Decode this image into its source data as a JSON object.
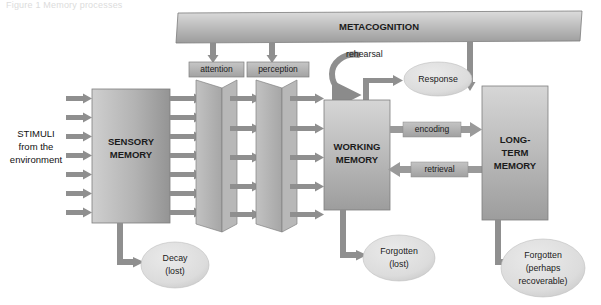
{
  "figure": {
    "caption": "Figure 1   Memory processes"
  },
  "colors": {
    "page_background": "#ffffff",
    "box_fill_light": "#c9c9c9",
    "box_fill_dark": "#9a9a9a",
    "bar_fill_light": "#d2d2d2",
    "bar_fill_dark": "#a0a0a0",
    "arrow_fill": "#8f8f8f",
    "ellipse_fill": "#d9d9d9",
    "chip_fill": "#b4b4b4",
    "text": "#1b1b1b",
    "outline": "#6f6f6f"
  },
  "nodes": {
    "metacognition": {
      "label": "METACOGNITION"
    },
    "attention": {
      "label": "attention"
    },
    "perception": {
      "label": "perception"
    },
    "sensory_memory": {
      "label_line1": "SENSORY",
      "label_line2": "MEMORY"
    },
    "working_memory": {
      "label_line1": "WORKING",
      "label_line2": "MEMORY"
    },
    "long_term_memory": {
      "label_line1": "LONG-",
      "label_line2": "TERM",
      "label_line3": "MEMORY"
    },
    "response": {
      "label": "Response"
    },
    "rehearsal": {
      "label": "rehearsal"
    },
    "stimuli": {
      "line1": "STIMULI",
      "line2": "from the",
      "line3": "environment"
    },
    "decay": {
      "label_line1": "Decay",
      "label_line2": "(lost)"
    },
    "forgotten_wm": {
      "label_line1": "Forgotten",
      "label_line2": "(lost)"
    },
    "forgotten_ltm": {
      "label_line1": "Forgotten",
      "label_line2": "(perhaps",
      "label_line3": "recoverable)"
    }
  },
  "edges": {
    "encoding": {
      "label": "encoding",
      "direction": "working-memory-to-long-term-memory"
    },
    "retrieval": {
      "label": "retrieval",
      "direction": "long-term-memory-to-working-memory"
    }
  },
  "counts": {
    "stimuli_arrows": 7,
    "sensory_out_arrows": 7,
    "filter1_out_arrows": 5,
    "filter2_out_arrows": 5,
    "metacognition_down_arrows": 3
  }
}
